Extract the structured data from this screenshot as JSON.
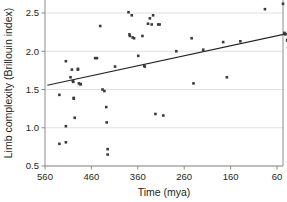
{
  "chart_data": {
    "type": "scatter",
    "title": "",
    "xlabel": "Time (mya)",
    "ylabel": "Limb complexity (Brillouin index)",
    "xlim": [
      570,
      20
    ],
    "ylim": [
      0.5,
      2.62
    ],
    "x_reversed": true,
    "grid": true,
    "grid_orientation": "horizontal",
    "legend": "none",
    "xticks": [
      560,
      460,
      360,
      260,
      160,
      60
    ],
    "xtick_labels": [
      "560",
      "460",
      "360",
      "260",
      "160",
      "60"
    ],
    "yticks": [
      0.5,
      1.0,
      1.5,
      2.0,
      2.5
    ],
    "ytick_labels": [
      "0.5",
      "1.0",
      "1.5",
      "2.0",
      "2.5"
    ],
    "marker": "square",
    "marker_color": "#3b3b3b",
    "marker_size": 2.6,
    "points": [
      [
        529,
        1.43
      ],
      [
        529,
        0.79
      ],
      [
        515,
        1.87
      ],
      [
        515,
        1.02
      ],
      [
        515,
        0.81
      ],
      [
        505,
        1.66
      ],
      [
        502,
        1.76
      ],
      [
        500,
        1.61
      ],
      [
        499,
        1.6
      ],
      [
        498,
        1.39
      ],
      [
        498,
        1.38
      ],
      [
        496,
        1.13
      ],
      [
        489,
        1.77
      ],
      [
        489,
        1.76
      ],
      [
        487,
        1.58
      ],
      [
        484,
        1.57
      ],
      [
        483,
        1.57
      ],
      [
        452,
        1.91
      ],
      [
        448,
        1.91
      ],
      [
        441,
        2.33
      ],
      [
        436,
        1.5
      ],
      [
        432,
        1.48
      ],
      [
        428,
        1.27
      ],
      [
        427,
        1.07
      ],
      [
        425,
        0.72
      ],
      [
        425,
        0.65
      ],
      [
        409,
        1.8
      ],
      [
        380,
        2.51
      ],
      [
        378,
        2.22
      ],
      [
        377,
        2.2
      ],
      [
        373,
        2.47
      ],
      [
        371,
        2.18
      ],
      [
        368,
        2.17
      ],
      [
        359,
        1.94
      ],
      [
        350,
        2.2
      ],
      [
        346,
        1.81
      ],
      [
        345,
        1.8
      ],
      [
        338,
        2.36
      ],
      [
        334,
        2.43
      ],
      [
        330,
        2.35
      ],
      [
        327,
        2.47
      ],
      [
        322,
        1.18
      ],
      [
        316,
        2.35
      ],
      [
        313,
        2.35
      ],
      [
        305,
        1.16
      ],
      [
        277,
        2.0
      ],
      [
        244,
        2.17
      ],
      [
        240,
        1.58
      ],
      [
        219,
        2.02
      ],
      [
        176,
        2.12
      ],
      [
        168,
        1.66
      ],
      [
        139,
        2.13
      ],
      [
        86,
        2.55
      ],
      [
        47,
        2.62
      ],
      [
        44,
        2.24
      ],
      [
        43,
        2.23
      ],
      [
        42,
        2.22
      ],
      [
        38,
        2.15
      ],
      [
        38,
        2.14
      ],
      [
        36,
        2.05
      ],
      [
        35,
        2.03
      ],
      [
        33,
        1.88
      ],
      [
        31,
        1.34
      ]
    ],
    "trendline": {
      "type": "linear-fit",
      "x_start": 555,
      "y_start": 1.555,
      "x_end": 35,
      "y_end": 2.235,
      "color": "#231f20"
    }
  },
  "axes": {
    "frame_color": "#9a9a9a",
    "grid_color": "#d8d8d8"
  }
}
